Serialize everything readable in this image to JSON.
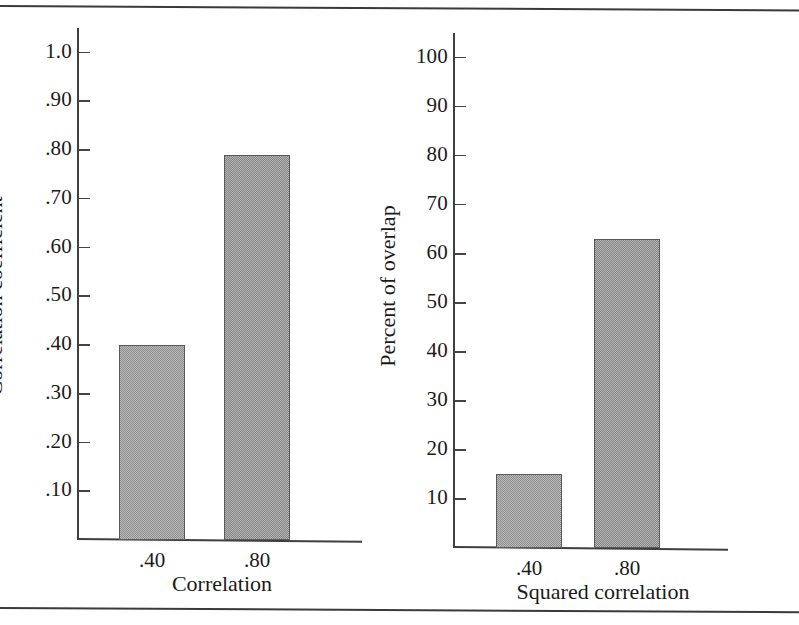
{
  "figure": {
    "background_color": "#ffffff",
    "rule_color": "#3a3a3a",
    "bar_fill_color": "#9d9d9d",
    "bar_edge_color": "#5a5a5a",
    "axis_color": "#3f3f3f",
    "text_color": "#1a1a1a"
  },
  "chart_data": [
    {
      "type": "bar",
      "panel": "left",
      "title": "",
      "xlabel": "Correlation",
      "ylabel": "Correlation coefficient",
      "categories": [
        ".40",
        ".80"
      ],
      "values": [
        0.4,
        0.79
      ],
      "ylim": [
        0,
        1.05
      ],
      "yticks": [
        1.0,
        0.9,
        0.8,
        0.7,
        0.6,
        0.5,
        0.4,
        0.3,
        0.2,
        0.1
      ],
      "ytick_labels": [
        "1.0",
        ".90",
        ".80",
        ".70",
        ".60",
        ".50",
        ".40",
        ".30",
        ".20",
        ".10"
      ],
      "grid": false,
      "legend": null
    },
    {
      "type": "bar",
      "panel": "right",
      "title": "",
      "xlabel": "Squared correlation",
      "ylabel": "Percent of overlap",
      "categories": [
        ".40",
        ".80"
      ],
      "values": [
        15,
        63
      ],
      "ylim": [
        0,
        105
      ],
      "yticks": [
        100,
        90,
        80,
        70,
        60,
        50,
        40,
        30,
        20,
        10
      ],
      "ytick_labels": [
        "100",
        "90",
        "80",
        "70",
        "60",
        "50",
        "40",
        "30",
        "20",
        "10"
      ],
      "grid": false,
      "legend": null
    }
  ]
}
